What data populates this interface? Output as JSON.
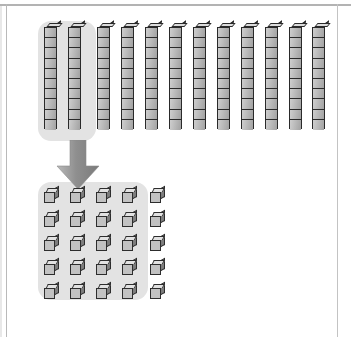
{
  "figure": {
    "kind": "base-ten-blocks-diagram",
    "background_color": "#ffffff",
    "frame_color": "#9a9a9a",
    "highlight_color": "#e3e3e3",
    "block_fill": "#c2c2c2",
    "block_outline": "#2d2d2d",
    "block_top_face": "#e2e2e2",
    "block_side_face": "#7d7d7d",
    "arrow_color": "#8c8c8c",
    "arrow_direction": "down"
  },
  "tens_row": {
    "label": "tens rods",
    "total_rods": 12,
    "segments_per_rod": 10,
    "highlighted_count": 2,
    "highlighted_value": 20,
    "total_value": 120,
    "rods": [
      {
        "index": 1,
        "highlighted": true,
        "x": 44,
        "y": 27
      },
      {
        "index": 2,
        "highlighted": true,
        "x": 68,
        "y": 27
      },
      {
        "index": 3,
        "highlighted": false,
        "x": 97,
        "y": 27
      },
      {
        "index": 4,
        "highlighted": false,
        "x": 121,
        "y": 27
      },
      {
        "index": 5,
        "highlighted": false,
        "x": 145,
        "y": 27
      },
      {
        "index": 6,
        "highlighted": false,
        "x": 169,
        "y": 27
      },
      {
        "index": 7,
        "highlighted": false,
        "x": 193,
        "y": 27
      },
      {
        "index": 8,
        "highlighted": false,
        "x": 217,
        "y": 27
      },
      {
        "index": 9,
        "highlighted": false,
        "x": 241,
        "y": 27
      },
      {
        "index": 10,
        "highlighted": false,
        "x": 265,
        "y": 27
      },
      {
        "index": 11,
        "highlighted": false,
        "x": 289,
        "y": 27
      },
      {
        "index": 12,
        "highlighted": false,
        "x": 312,
        "y": 27
      }
    ],
    "highlight_box": {
      "x": 38,
      "y": 21,
      "width": 58,
      "height": 120
    }
  },
  "arrow": {
    "label": "regroup-arrow",
    "x": 55,
    "y": 140,
    "width": 46,
    "height": 50
  },
  "ones_grid": {
    "label": "unit cubes",
    "columns": 4,
    "rows": 5,
    "highlighted_count": 20,
    "loose_count": 5,
    "total_count": 25,
    "origin_x": 44,
    "origin_y": 188,
    "step_x": 26,
    "step_y": 24,
    "loose_x": 150,
    "highlight_box": {
      "x": 38,
      "y": 182,
      "width": 110,
      "height": 118
    }
  }
}
